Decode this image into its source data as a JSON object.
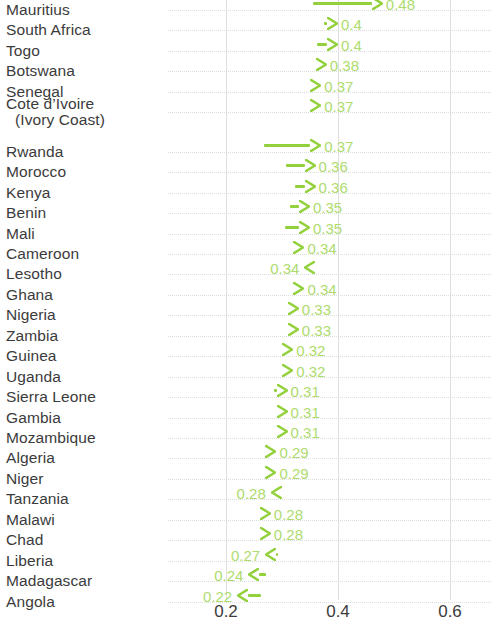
{
  "chart_data": {
    "type": "bar",
    "title": "",
    "subtitle": "",
    "xlabel": "",
    "ylabel": "",
    "xlim": [
      0.13,
      0.68
    ],
    "xticks": [
      0.2,
      0.4,
      0.6
    ],
    "xtick_labels": [
      "0.2",
      "0.4",
      "0.6"
    ],
    "grid": true,
    "legend": false,
    "orientation": "horizontal",
    "marker": "arrow",
    "accent_color": "#93D13C",
    "value_label_color": "#AEDB6E",
    "text_color": "#3b3b3b",
    "gridline_color": "#dedede",
    "rowline_color": "#dcdcdc",
    "categories": [
      "Mauritius",
      "South Africa",
      "Togo",
      "Botswana",
      "Senegal",
      "Cote d’Ivoire (Ivory Coast)",
      "Rwanda",
      "Morocco",
      "Kenya",
      "Benin",
      "Mali",
      "Cameroon",
      "Lesotho",
      "Ghana",
      "Nigeria",
      "Zambia",
      "Guinea",
      "Uganda",
      "Sierra Leone",
      "Gambia",
      "Mozambique",
      "Algeria",
      "Niger",
      "Tanzania",
      "Malawi",
      "Chad",
      "Liberia",
      "Madagascar",
      "Angola"
    ],
    "values": [
      0.48,
      0.4,
      0.4,
      0.38,
      0.37,
      0.37,
      0.37,
      0.36,
      0.36,
      0.35,
      0.35,
      0.34,
      0.34,
      0.34,
      0.33,
      0.33,
      0.32,
      0.32,
      0.31,
      0.31,
      0.31,
      0.29,
      0.29,
      0.28,
      0.28,
      0.28,
      0.27,
      0.24,
      0.22
    ],
    "start_values": [
      0.355,
      0.375,
      0.362,
      0.368,
      0.357,
      0.352,
      0.267,
      0.308,
      0.323,
      0.315,
      0.305,
      0.322,
      0.352,
      0.325,
      0.315,
      0.312,
      0.302,
      0.308,
      0.285,
      0.318,
      0.308,
      0.297,
      0.285,
      0.298,
      0.288,
      0.293,
      0.292,
      0.272,
      0.262
    ]
  },
  "rows": [
    {
      "label": "Mauritius",
      "label2": "",
      "value": "0.48",
      "direction": "right"
    },
    {
      "label": "South Africa",
      "label2": "",
      "value": "0.4",
      "direction": "right"
    },
    {
      "label": "Togo",
      "label2": "",
      "value": "0.4",
      "direction": "right"
    },
    {
      "label": "Botswana",
      "label2": "",
      "value": "0.38",
      "direction": "right"
    },
    {
      "label": "Senegal",
      "label2": "",
      "value": "0.37",
      "direction": "right"
    },
    {
      "label": "Cote d’Ivoire",
      "label2": "(Ivory Coast)",
      "value": "0.37",
      "direction": "right"
    },
    {
      "label": "Rwanda",
      "label2": "",
      "value": "0.37",
      "direction": "right"
    },
    {
      "label": "Morocco",
      "label2": "",
      "value": "0.36",
      "direction": "right"
    },
    {
      "label": "Kenya",
      "label2": "",
      "value": "0.36",
      "direction": "right"
    },
    {
      "label": "Benin",
      "label2": "",
      "value": "0.35",
      "direction": "right"
    },
    {
      "label": "Mali",
      "label2": "",
      "value": "0.35",
      "direction": "right"
    },
    {
      "label": "Cameroon",
      "label2": "",
      "value": "0.34",
      "direction": "right"
    },
    {
      "label": "Lesotho",
      "label2": "",
      "value": "0.34",
      "direction": "left"
    },
    {
      "label": "Ghana",
      "label2": "",
      "value": "0.34",
      "direction": "right"
    },
    {
      "label": "Nigeria",
      "label2": "",
      "value": "0.33",
      "direction": "right"
    },
    {
      "label": "Zambia",
      "label2": "",
      "value": "0.33",
      "direction": "right"
    },
    {
      "label": "Guinea",
      "label2": "",
      "value": "0.32",
      "direction": "right"
    },
    {
      "label": "Uganda",
      "label2": "",
      "value": "0.32",
      "direction": "right"
    },
    {
      "label": "Sierra Leone",
      "label2": "",
      "value": "0.31",
      "direction": "right"
    },
    {
      "label": "Gambia",
      "label2": "",
      "value": "0.31",
      "direction": "right"
    },
    {
      "label": "Mozambique",
      "label2": "",
      "value": "0.31",
      "direction": "right"
    },
    {
      "label": "Algeria",
      "label2": "",
      "value": "0.29",
      "direction": "right"
    },
    {
      "label": "Niger",
      "label2": "",
      "value": "0.29",
      "direction": "right"
    },
    {
      "label": "Tanzania",
      "label2": "",
      "value": "0.28",
      "direction": "left"
    },
    {
      "label": "Malawi",
      "label2": "",
      "value": "0.28",
      "direction": "right"
    },
    {
      "label": "Chad",
      "label2": "",
      "value": "0.28",
      "direction": "right"
    },
    {
      "label": "Liberia",
      "label2": "",
      "value": "0.27",
      "direction": "left"
    },
    {
      "label": "Madagascar",
      "label2": "",
      "value": "0.24",
      "direction": "left"
    },
    {
      "label": "Angola",
      "label2": "",
      "value": "0.22",
      "direction": "left"
    }
  ],
  "axis": {
    "ticks": [
      "0.2",
      "0.4",
      "0.6"
    ]
  }
}
